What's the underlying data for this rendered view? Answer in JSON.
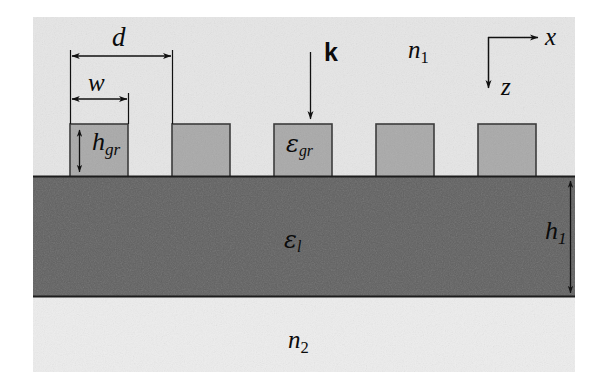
{
  "figure": {
    "type": "schematic-cross-section",
    "width": 608,
    "height": 385,
    "colors": {
      "background": "#ffffff",
      "superstrate": "#e4e4e4",
      "substrate_medium": "#ebebeb",
      "grating_bar_fill": "#a8a8a8",
      "waveguide_fill": "#5e5e5e",
      "outline": "#3a3a3a",
      "annotation": "#0b0b0b"
    }
  },
  "geometry": {
    "frame": {
      "x": 33,
      "y": 17,
      "width": 542,
      "height": 355
    },
    "superstrate": {
      "y": 17,
      "height": 159
    },
    "waveguide": {
      "y": 176,
      "height": 121
    },
    "bottom_medium": {
      "y": 297,
      "height": 75
    },
    "bar_top_y": 124,
    "bar_bottom_y": 176,
    "bars": [
      {
        "x": 70,
        "width": 58
      },
      {
        "x": 172,
        "width": 58
      },
      {
        "x": 274,
        "width": 58
      },
      {
        "x": 376,
        "width": 58
      },
      {
        "x": 478,
        "width": 58
      }
    ],
    "period_px": 102,
    "bar_width_px": 58
  },
  "labels": {
    "period": {
      "text": "d",
      "x": 112,
      "y": 29,
      "size": 27
    },
    "linewidth": {
      "text": "w",
      "x": 88,
      "y": 72,
      "size": 25
    },
    "grating_height": {
      "base": "h",
      "sub": "gr",
      "x": 92,
      "y": 133,
      "size": 26
    },
    "grating_permittivity": {
      "base": "ε",
      "sub": "gr",
      "x": 286,
      "y": 136,
      "size": 24
    },
    "layer_permittivity": {
      "base": "ε",
      "sub": "l",
      "x": 284,
      "y": 232,
      "size": 24
    },
    "layer_thickness": {
      "base": "h",
      "sub": "1",
      "x": 545,
      "y": 222,
      "size": 26
    },
    "wavevector": {
      "text": "k",
      "x": 324,
      "y": 44,
      "size": 25
    },
    "index_superstrate": {
      "base": "n",
      "sub": "1",
      "x": 408,
      "y": 40,
      "size": 25
    },
    "index_substrate": {
      "base": "n",
      "sub": "2",
      "x": 288,
      "y": 330,
      "size": 25
    },
    "axis_x": {
      "text": "x",
      "x": 545,
      "y": 28,
      "size": 25
    },
    "axis_z": {
      "text": "z",
      "x": 501,
      "y": 78,
      "size": 25
    }
  },
  "annotations": {
    "dimension_d": {
      "x1": 70,
      "x2": 172,
      "y": 56,
      "style": "double-arrow"
    },
    "dimension_w": {
      "x1": 70,
      "x2": 128,
      "y": 99,
      "style": "double-arrow"
    },
    "dimension_h_gr": {
      "x": 79,
      "y1": 128,
      "y2": 172,
      "style": "double-arrow-vertical"
    },
    "dimension_h_1": {
      "x": 570,
      "y1": 180,
      "y2": 294,
      "style": "double-arrow-vertical"
    },
    "extension_line_left": {
      "x": 70,
      "y1": 52,
      "y2": 124
    },
    "extension_line_period_right": {
      "x": 172,
      "y1": 52,
      "y2": 124
    },
    "extension_line_width_right": {
      "x": 128,
      "y1": 95,
      "y2": 124
    },
    "wavevector_arrow": {
      "x": 310,
      "y1": 52,
      "y2": 120,
      "style": "single-arrow-down"
    },
    "axis_origin": {
      "x": 488,
      "y": 37
    },
    "axis_x_arrow": {
      "x1": 488,
      "x2": 540,
      "y": 37,
      "style": "single-arrow-right"
    },
    "axis_z_arrow": {
      "x": 488,
      "y1": 37,
      "y2": 90,
      "style": "single-arrow-down"
    }
  }
}
